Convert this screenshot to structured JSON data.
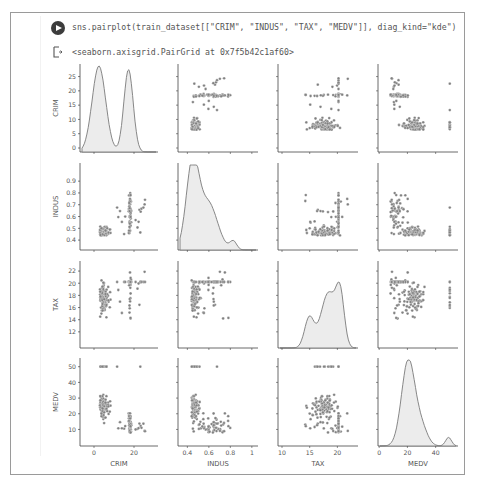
{
  "cell": {
    "run_button_label": "Run cell",
    "code_prefix": "sns.pairplot(train_dataset[[",
    "code_args": [
      "\"CRIM\"",
      "\"INDUS\"",
      "\"TAX\"",
      "\"MEDV\""
    ],
    "code_suffix": "]], diag_kind=\"kde\")",
    "code_full": "sns.pairplot(train_dataset[[\"CRIM\", \"INDUS\", \"TAX\", \"MEDV\"]], diag_kind=\"kde\")",
    "output_text": "<seaborn.axisgrid.PairGrid at 0x7f5b42c1af60>"
  },
  "chart_data": {
    "type": "scatter",
    "title": "",
    "variables": [
      "CRIM",
      "INDUS",
      "TAX",
      "MEDV"
    ],
    "diag_kind": "kde",
    "axes": {
      "CRIM": {
        "label": "CRIM",
        "yticks": [
          0,
          5,
          10,
          15,
          20,
          25
        ],
        "xticks": [
          0,
          20
        ],
        "range": [
          -5,
          30
        ]
      },
      "INDUS": {
        "label": "INDUS",
        "yticks": [
          0.4,
          0.5,
          0.6,
          0.7,
          0.8,
          0.9
        ],
        "xticks": [
          0.4,
          0.6,
          0.8,
          1.0
        ],
        "range": [
          0.35,
          1.02
        ]
      },
      "TAX": {
        "label": "TAX",
        "yticks": [
          12,
          14,
          16,
          18,
          20,
          22
        ],
        "xticks": [
          10,
          15,
          20
        ],
        "range": [
          10,
          23
        ]
      },
      "MEDV": {
        "label": "MEDV",
        "yticks": [
          10,
          20,
          30,
          40,
          50
        ],
        "xticks": [
          0,
          20,
          40
        ],
        "range": [
          2,
          53
        ]
      }
    },
    "diagonal_kde": {
      "CRIM": {
        "peaks": [
          [
            3,
            28
          ],
          [
            15,
            27
          ]
        ],
        "trough": [
          9,
          9
        ]
      },
      "INDUS": {
        "peak": [
          0.45,
          1.0
        ],
        "shoulder": [
          0.65,
          0.45
        ],
        "minor_peak": [
          0.82,
          0.1
        ]
      },
      "TAX": {
        "minor_peak": [
          15,
          0.35
        ],
        "peak": [
          20,
          1.0
        ]
      },
      "MEDV": {
        "peak": [
          21,
          1.0
        ],
        "minor_peak": [
          48,
          0.12
        ]
      }
    },
    "grid": false,
    "legend": "none",
    "marker_color": "#808080",
    "fill_color": "#ececec"
  }
}
